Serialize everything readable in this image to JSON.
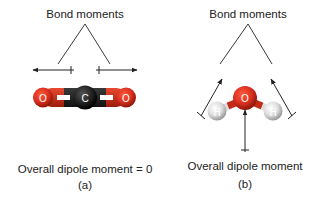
{
  "panels": [
    {
      "id": "a",
      "molecule": "CO2",
      "bond_moments_label": "Bond moments",
      "overall_label": "Overall dipole moment = 0",
      "caption": "(a)",
      "atoms": [
        {
          "symbol": "O",
          "label": "O",
          "color": "#d8301f"
        },
        {
          "symbol": "C",
          "label": "C",
          "color": "#1e1e1e"
        },
        {
          "symbol": "O",
          "label": "O",
          "color": "#d8301f"
        }
      ]
    },
    {
      "id": "b",
      "molecule": "H2O",
      "bond_moments_label": "Bond moments",
      "overall_label": "Overall dipole moment",
      "caption": "(b)",
      "atoms": [
        {
          "symbol": "O",
          "label": "O",
          "color": "#d8301f"
        },
        {
          "symbol": "H",
          "label": "H",
          "color": "#e6e6e6"
        },
        {
          "symbol": "H",
          "label": "H",
          "color": "#e6e6e6"
        }
      ]
    }
  ],
  "colors": {
    "oxygen": "#d8301f",
    "carbon": "#1e1e1e",
    "hydrogen": "#e6e6e6",
    "line": "#222222",
    "text": "#222222"
  }
}
